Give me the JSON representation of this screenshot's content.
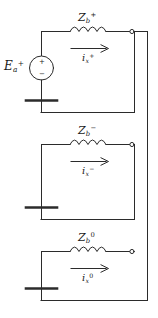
{
  "figure": {
    "line_color": "#2b2b2b",
    "text_color": "#1a1a1a",
    "background": "#ffffff",
    "width": 158,
    "height": 318
  },
  "source": {
    "name": "voltage-source",
    "symbol_plus": "+",
    "symbol_minus": "−",
    "label_var": "E",
    "label_sub": "a",
    "label_sup": "+"
  },
  "sections": [
    {
      "id": "positive-sequence",
      "impedance": {
        "var": "Z",
        "sub": "b",
        "sup": "+"
      },
      "current": {
        "var": "i",
        "sub": "x",
        "sup": "+"
      },
      "terminal": "open-terminal-node",
      "ground": "ground-bar"
    },
    {
      "id": "negative-sequence",
      "impedance": {
        "var": "Z",
        "sub": "b",
        "sup": "−"
      },
      "current": {
        "var": "i",
        "sub": "x",
        "sup": "−"
      },
      "terminal": "open-terminal-node",
      "ground": "ground-bar"
    },
    {
      "id": "zero-sequence",
      "impedance": {
        "var": "Z",
        "sub": "b",
        "sup": "0"
      },
      "current": {
        "var": "i",
        "sub": "x",
        "sup": "0"
      },
      "terminal": "open-terminal-node",
      "ground": "ground-bar"
    }
  ]
}
